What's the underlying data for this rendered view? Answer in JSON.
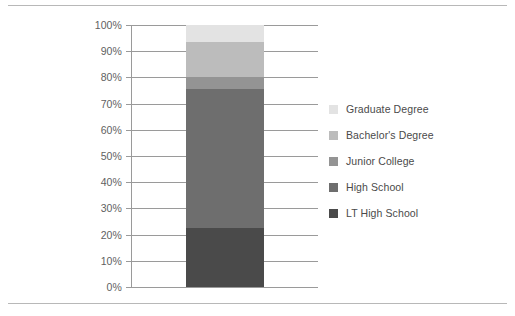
{
  "chart_data": {
    "type": "bar",
    "title": "",
    "subtitle": "",
    "xlabel": "",
    "ylabel": "",
    "stacked": true,
    "percent_stacked": true,
    "orientation": "vertical",
    "grid": true,
    "legend_position": "right",
    "categories": [
      ""
    ],
    "ylim": [
      0,
      100
    ],
    "ytick_values": [
      0,
      10,
      20,
      30,
      40,
      50,
      60,
      70,
      80,
      90,
      100
    ],
    "ytick_labels": [
      "0%",
      "10%",
      "20%",
      "30%",
      "40%",
      "50%",
      "60%",
      "70%",
      "80%",
      "90%",
      "100%"
    ],
    "series": [
      {
        "name": "LT High School",
        "values": [
          22.5
        ],
        "color": "#4a4a4a",
        "cumulative_start": 0,
        "cumulative_end": 22.5
      },
      {
        "name": "High School",
        "values": [
          53.0
        ],
        "color": "#6e6e6e",
        "cumulative_start": 22.5,
        "cumulative_end": 75.5
      },
      {
        "name": "Junior College",
        "values": [
          4.5
        ],
        "color": "#949494",
        "cumulative_start": 75.5,
        "cumulative_end": 80.0
      },
      {
        "name": "Bachelor's Degree",
        "values": [
          13.5
        ],
        "color": "#bcbcbc",
        "cumulative_start": 80.0,
        "cumulative_end": 93.5
      },
      {
        "name": "Graduate Degree",
        "values": [
          6.5
        ],
        "color": "#e3e3e3",
        "cumulative_start": 93.5,
        "cumulative_end": 100.0
      }
    ]
  },
  "axis": {
    "ticks": [
      {
        "label": "100%",
        "value": 100
      },
      {
        "label": "90%",
        "value": 90
      },
      {
        "label": "80%",
        "value": 80
      },
      {
        "label": "70%",
        "value": 70
      },
      {
        "label": "60%",
        "value": 60
      },
      {
        "label": "50%",
        "value": 50
      },
      {
        "label": "40%",
        "value": 40
      },
      {
        "label": "30%",
        "value": 30
      },
      {
        "label": "20%",
        "value": 20
      },
      {
        "label": "10%",
        "value": 10
      },
      {
        "label": "0%",
        "value": 0
      }
    ]
  },
  "legend": {
    "items": [
      {
        "label": "Graduate Degree",
        "color": "#e3e3e3"
      },
      {
        "label": "Bachelor's Degree",
        "color": "#bcbcbc"
      },
      {
        "label": "Junior College",
        "color": "#949494"
      },
      {
        "label": "High School",
        "color": "#6e6e6e"
      },
      {
        "label": "LT High School",
        "color": "#4a4a4a"
      }
    ]
  },
  "colors": {
    "grid": "#9a9a9a",
    "axis": "#9a9a9a",
    "rule": "#b8b8b8",
    "tick_text": "#5f5f5f",
    "legend_text": "#4a4a4a",
    "background": "#ffffff"
  }
}
